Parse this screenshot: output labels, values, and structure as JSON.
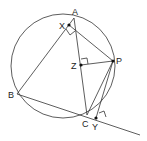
{
  "diagram": {
    "circle": {
      "cx": 63,
      "cy": 66,
      "r": 52
    },
    "points": {
      "A": {
        "label": "A",
        "x": 74,
        "y": 18
      },
      "B": {
        "label": "B",
        "x": 17,
        "y": 94
      },
      "C": {
        "label": "C",
        "x": 87,
        "y": 115
      },
      "P": {
        "label": "P",
        "x": 113,
        "y": 61
      },
      "X": {
        "label": "X",
        "x": 69,
        "y": 25
      },
      "Y": {
        "label": "Y",
        "x": 96,
        "y": 118
      },
      "Z": {
        "label": "Z",
        "x": 81,
        "y": 65
      }
    },
    "right_angle_marks": [
      "X",
      "Z",
      "Y"
    ]
  }
}
